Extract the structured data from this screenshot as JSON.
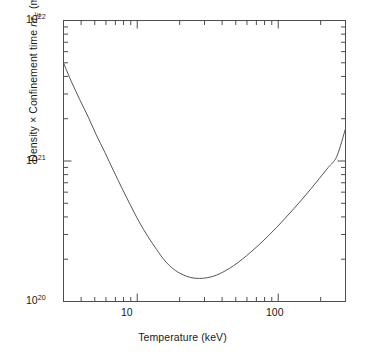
{
  "figure": {
    "background": "#ffffff",
    "frame_color": "#4d4d4d",
    "curve_color": "#555555"
  },
  "axes": {
    "x_title": "Temperature (keV)",
    "y_title_parts": {
      "lead": "Density × Confinement time ",
      "symbol_n": "n",
      "symbol_tau": "τ",
      "symbol_sub": "E",
      "units_open": " (m",
      "units_exp": "−3",
      "units_close": " s)"
    },
    "x_tick_labels": [
      {
        "value": 10,
        "text": "10"
      },
      {
        "value": 100,
        "text": "100"
      }
    ],
    "y_tick_labels": [
      {
        "value": 1e+22,
        "mantissa": "10",
        "exponent": "22"
      },
      {
        "value": 1e+21,
        "mantissa": "10",
        "exponent": "21"
      },
      {
        "value": 1e+20,
        "mantissa": "10",
        "exponent": "20"
      }
    ]
  },
  "chart_data": {
    "type": "line",
    "title": "",
    "subtitle": "",
    "xlabel": "Temperature (keV)",
    "ylabel": "Density × Confinement time nτE (m−3 s)",
    "xscale": "log",
    "yscale": "log",
    "xlim": [
      3.0,
      300.0
    ],
    "ylim": [
      1e+20,
      1e+22
    ],
    "grid": false,
    "legend": null,
    "legend_position": "none",
    "annotations": [],
    "series": [
      {
        "name": "Lawson criterion nτE",
        "color": "#555555",
        "linewidth": 1.0,
        "x": [
          3.0,
          3.4,
          3.9,
          4.5,
          5.1,
          5.9,
          6.8,
          7.8,
          9.0,
          10.3,
          11.9,
          13.7,
          15.7,
          18.1,
          20.8,
          24.0,
          27.6,
          31.7,
          36.5,
          42.0,
          48.3,
          55.6,
          64.0,
          73.6,
          84.7,
          97.5,
          112.2,
          129.1,
          148.5,
          170.9,
          196.6,
          226.3,
          260.4,
          300.0
        ],
        "y": [
          5e+21,
          3.7e+21,
          2.75e+21,
          2.05e+21,
          1.55e+21,
          1.15e+21,
          8.5e+20,
          6.4e+20,
          4.8e+20,
          3.7e+20,
          2.9e+20,
          2.35e+20,
          1.95e+20,
          1.7e+20,
          1.56e+20,
          1.48e+20,
          1.46e+20,
          1.48e+20,
          1.54e+20,
          1.65e+20,
          1.8e+20,
          2e+20,
          2.25e+20,
          2.55e+20,
          2.92e+20,
          3.37e+20,
          3.92e+20,
          4.58e+20,
          5.38e+20,
          6.35e+20,
          7.55e+20,
          9e+20,
          1.08e+21,
          1.7e+21
        ]
      }
    ],
    "minimum_point": {
      "x": 27.6,
      "y": 1.46e+20
    }
  }
}
